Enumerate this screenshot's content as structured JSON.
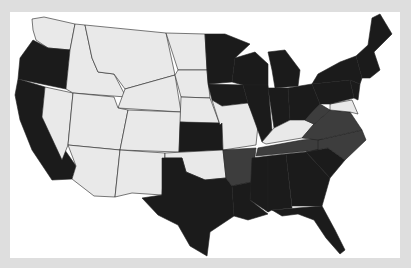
{
  "map": {
    "title": "",
    "type": "choropleth",
    "region": "Contiguous United States",
    "legend": [],
    "colors": {
      "frame_background": "#dedede",
      "panel_background": "#ffffff",
      "category_dark": "#1b1b1b",
      "category_medium": "#3d3d3d",
      "category_light": "#e9e9e9",
      "border": "#222222"
    },
    "categories": {
      "dark": [
        "WA-partial",
        "OR",
        "CA",
        "MN",
        "WI",
        "MI",
        "IL",
        "IN",
        "OH",
        "PA",
        "NY",
        "VT",
        "NH",
        "ME",
        "MA",
        "CT",
        "RI",
        "NJ",
        "IA",
        "KS",
        "TX",
        "LA",
        "MS",
        "AL",
        "GA",
        "SC",
        "FL",
        "DE"
      ],
      "medium": [
        "VA",
        "TN",
        "NC",
        "AR",
        "WV"
      ],
      "light": [
        "WA",
        "ID",
        "MT",
        "ND",
        "SD",
        "NE",
        "NV",
        "UT",
        "CO",
        "WY",
        "AZ",
        "NM",
        "OK",
        "MO",
        "KY",
        "MD"
      ]
    }
  }
}
